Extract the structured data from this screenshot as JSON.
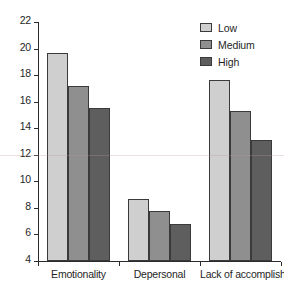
{
  "chart_data": {
    "type": "bar",
    "title": "",
    "xlabel": "",
    "ylabel": "",
    "ylim": [
      4,
      22
    ],
    "ytick_step": 2,
    "yticks": [
      4,
      6,
      8,
      10,
      12,
      14,
      16,
      18,
      20,
      22
    ],
    "grid": false,
    "legend_position": "top-right",
    "categories": [
      "Emotionality",
      "Depersonal",
      "Lack of accomplish"
    ],
    "series": [
      {
        "name": "Low",
        "color": "#cfcfcf",
        "values": [
          19.65,
          8.7,
          17.6
        ]
      },
      {
        "name": "Medium",
        "color": "#8f8f8f",
        "values": [
          17.15,
          7.75,
          15.3
        ]
      },
      {
        "name": "High",
        "color": "#5e5e5e",
        "values": [
          15.5,
          6.8,
          13.15
        ]
      }
    ]
  },
  "legend": {
    "entries": [
      {
        "label": "Low"
      },
      {
        "label": "Medium"
      },
      {
        "label": "High"
      }
    ]
  }
}
